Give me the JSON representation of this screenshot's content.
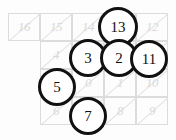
{
  "figure": {
    "background_color": "#ffffff",
    "grid_line_color": "#dcdcdc",
    "grid_number_color": "#d9d9d9",
    "circle_stroke_color": "#111111",
    "circle_fill_color": "#ffffff"
  },
  "chart_data": {
    "type": "table",
    "rows": 4,
    "columns": 4,
    "cell_width": 32,
    "cell_height": 28,
    "origin_x": 40,
    "origin_y": 13,
    "grid_cells": [
      {
        "row": 0,
        "col": -1,
        "label": "16",
        "visible": true,
        "x": 8,
        "y": 13
      },
      {
        "row": 0,
        "col": 0,
        "label": "15",
        "visible": true,
        "x": 40,
        "y": 13
      },
      {
        "row": 0,
        "col": 1,
        "label": "14",
        "visible": true,
        "x": 72,
        "y": 13
      },
      {
        "row": 0,
        "col": 2,
        "label": "13",
        "visible": false,
        "x": 104,
        "y": 13
      },
      {
        "row": 0,
        "col": 3,
        "label": "12",
        "visible": true,
        "x": 136,
        "y": 13
      },
      {
        "row": 1,
        "col": 0,
        "label": "4",
        "visible": true,
        "x": 40,
        "y": 41
      },
      {
        "row": 1,
        "col": 1,
        "label": "3",
        "visible": false,
        "x": 72,
        "y": 41
      },
      {
        "row": 1,
        "col": 2,
        "label": "2",
        "visible": false,
        "x": 104,
        "y": 41
      },
      {
        "row": 1,
        "col": 3,
        "label": "11",
        "visible": false,
        "x": 136,
        "y": 41
      },
      {
        "row": 2,
        "col": 0,
        "label": "5",
        "visible": false,
        "x": 40,
        "y": 69
      },
      {
        "row": 2,
        "col": 1,
        "label": "0",
        "visible": true,
        "x": 72,
        "y": 69
      },
      {
        "row": 2,
        "col": 2,
        "label": "1",
        "visible": true,
        "x": 104,
        "y": 69
      },
      {
        "row": 2,
        "col": 3,
        "label": "10",
        "visible": true,
        "x": 136,
        "y": 69
      },
      {
        "row": 3,
        "col": 0,
        "label": "6",
        "visible": true,
        "x": 40,
        "y": 97
      },
      {
        "row": 3,
        "col": 1,
        "label": "7",
        "visible": false,
        "x": 72,
        "y": 97
      },
      {
        "row": 3,
        "col": 2,
        "label": "8",
        "visible": true,
        "x": 104,
        "y": 97
      },
      {
        "row": 3,
        "col": 3,
        "label": "9",
        "visible": true,
        "x": 136,
        "y": 97
      }
    ],
    "circled_values": [
      {
        "label": "13",
        "cx": 118,
        "cy": 27,
        "r": 20
      },
      {
        "label": "3",
        "cx": 88,
        "cy": 58,
        "r": 19
      },
      {
        "label": "2",
        "cx": 119,
        "cy": 58,
        "r": 19
      },
      {
        "label": "11",
        "cx": 149,
        "cy": 59,
        "r": 19
      },
      {
        "label": "5",
        "cx": 57,
        "cy": 87,
        "r": 19
      },
      {
        "label": "7",
        "cx": 88,
        "cy": 116,
        "r": 19
      }
    ]
  }
}
